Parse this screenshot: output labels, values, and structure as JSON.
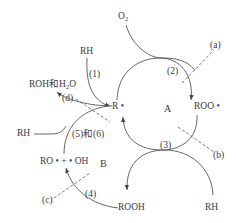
{
  "diagram": {
    "type": "reaction-cycle",
    "colors": {
      "line": "#555555",
      "text": "#3a3a3a",
      "background": "#ffffff"
    },
    "cycles": [
      {
        "id": "A",
        "label": "A"
      },
      {
        "id": "B",
        "label": "B"
      }
    ],
    "species": {
      "o2_main": "O",
      "o2_sub": "2",
      "r_radical": "R •",
      "roo_radical": "ROO •",
      "rh_top": "RH",
      "rh_left": "RH",
      "rh_bottom": "RH",
      "rooh": "ROOH",
      "ro_oh": "RO • + • OH",
      "roh_h2o_main": "ROH和H",
      "roh_h2o_sub": "2",
      "roh_h2o_tail": "O"
    },
    "steps": {
      "step1": "(1)",
      "step2": "(2)",
      "step3": "(3)",
      "step4": "(4)",
      "step56": "(5)和(6)"
    },
    "callouts": {
      "a": "(a)",
      "b": "(b)",
      "c": "(c)",
      "d": "(d)"
    }
  }
}
